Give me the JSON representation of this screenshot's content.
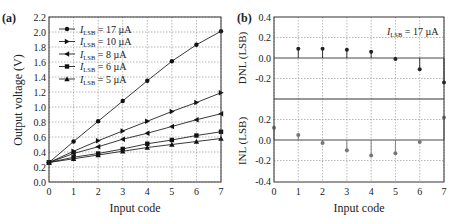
{
  "chart_data": [
    {
      "panel_label": "(a)",
      "type": "line",
      "title": "",
      "xlabel": "Input code",
      "ylabel": "Output voltage (V)",
      "xlim": [
        0,
        7
      ],
      "ylim": [
        0.0,
        2.2
      ],
      "x_ticks": [
        "0",
        "1",
        "2",
        "3",
        "4",
        "5",
        "6",
        "7"
      ],
      "y_ticks": [
        "0.0",
        "0.2",
        "0.4",
        "0.6",
        "0.8",
        "1.0",
        "1.2",
        "1.4",
        "1.6",
        "1.8",
        "2.0",
        "2.2"
      ],
      "grid": true,
      "legend_position": "upper left",
      "x": [
        0,
        1,
        2,
        3,
        4,
        5,
        6,
        7
      ],
      "series": [
        {
          "name": "I_LSB = 17 µA",
          "label_main": "I",
          "label_sub": "LSB",
          "label_rest": " = 17  µA",
          "marker": "circle",
          "values": [
            0.26,
            0.54,
            0.81,
            1.08,
            1.35,
            1.61,
            1.83,
            2.01
          ]
        },
        {
          "name": "I_LSB = 10 µA",
          "label_main": "I",
          "label_sub": "LSB",
          "label_rest": " = 10  µA",
          "marker": "right-triangle",
          "values": [
            0.26,
            0.41,
            0.55,
            0.68,
            0.81,
            0.94,
            1.06,
            1.19
          ]
        },
        {
          "name": "I_LSB = 8 µA",
          "label_main": "I",
          "label_sub": "LSB",
          "label_rest": " = 8  µA",
          "marker": "left-triangle",
          "values": [
            0.26,
            0.38,
            0.47,
            0.57,
            0.65,
            0.74,
            0.83,
            0.91
          ]
        },
        {
          "name": "I_LSB = 6 µA",
          "label_main": "I",
          "label_sub": "LSB",
          "label_rest": " = 6  µA",
          "marker": "square",
          "values": [
            0.26,
            0.33,
            0.38,
            0.44,
            0.51,
            0.56,
            0.62,
            0.67
          ]
        },
        {
          "name": "I_LSB = 5 µA",
          "label_main": "I",
          "label_sub": "LSB",
          "label_rest": " = 5  µA",
          "marker": "up-triangle",
          "values": [
            0.26,
            0.31,
            0.36,
            0.41,
            0.46,
            0.5,
            0.54,
            0.58
          ]
        }
      ]
    },
    {
      "panel_label": "(b)",
      "type": "scatter",
      "title": "",
      "xlabel": "Input code",
      "annotation": {
        "main": "I",
        "sub": "LSB",
        "rest": " = 17  µA"
      },
      "x_ticks": [
        "0",
        "1",
        "2",
        "3",
        "4",
        "5",
        "6",
        "7"
      ],
      "grid": true,
      "subplots": [
        {
          "name": "DNL",
          "ylabel": "DNL (LSB)",
          "ylim": [
            -0.4,
            0.4
          ],
          "y_ticks": [
            "0.4",
            "0.2",
            "0.0",
            "-0.2"
          ],
          "x": [
            1,
            2,
            3,
            4,
            5,
            6,
            7
          ],
          "values": [
            0.09,
            0.09,
            0.08,
            0.06,
            -0.01,
            -0.11,
            -0.24
          ],
          "color": "#222222"
        },
        {
          "name": "INL",
          "ylabel": "INL (LSB)",
          "ylim": [
            -0.4,
            0.4
          ],
          "y_ticks": [
            "0.2",
            "0.0",
            "-0.2",
            "-0.4"
          ],
          "x": [
            0,
            1,
            2,
            3,
            4,
            5,
            6,
            7
          ],
          "values": [
            0.12,
            0.05,
            -0.03,
            -0.1,
            -0.15,
            -0.13,
            -0.02,
            0.22
          ],
          "color": "#777777"
        }
      ]
    }
  ]
}
